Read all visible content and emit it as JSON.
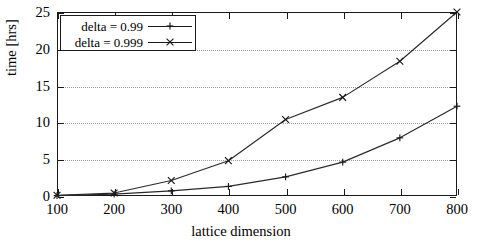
{
  "chart_data": {
    "type": "line",
    "title": "",
    "xlabel": "lattice dimension",
    "ylabel": "time [hrs]",
    "xlim": [
      100,
      800
    ],
    "ylim": [
      0,
      25
    ],
    "xticks": [
      100,
      200,
      300,
      400,
      500,
      600,
      700,
      800
    ],
    "yticks": [
      0,
      5,
      10,
      15,
      20,
      25
    ],
    "xtick_labels": [
      "100",
      "200",
      "300",
      "400",
      "500",
      "600",
      "700",
      "800"
    ],
    "ytick_labels": [
      "0",
      "5",
      "10",
      "15",
      "20",
      "25"
    ],
    "grid": "horizontal-dotted",
    "legend_position": "upper-left",
    "x": [
      100,
      200,
      300,
      400,
      500,
      600,
      700,
      800
    ],
    "series": [
      {
        "name": "delta = 0.99",
        "marker": "plus",
        "values": [
          0.05,
          0.25,
          0.7,
          1.3,
          2.6,
          4.6,
          7.9,
          12.2
        ]
      },
      {
        "name": "delta = 0.999",
        "marker": "cross",
        "values": [
          0.1,
          0.4,
          2.1,
          4.8,
          10.4,
          13.4,
          18.3,
          25.0
        ]
      }
    ]
  },
  "legend": {
    "entries": [
      {
        "label": "delta = 0.99",
        "marker": "plus-marker-icon"
      },
      {
        "label": "delta = 0.999",
        "marker": "cross-marker-icon"
      }
    ]
  },
  "axes": {
    "x_title": "lattice dimension",
    "y_title": "time [hrs]"
  },
  "colors": {
    "line": "#2a2a2a",
    "axis": "#1a1a1a",
    "grid": "#9a9a9a",
    "background": "#ffffff"
  }
}
